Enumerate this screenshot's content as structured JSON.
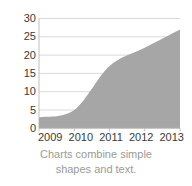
{
  "chart_data": {
    "type": "area",
    "title": "",
    "subtitle": "",
    "xlabel": "",
    "ylabel": "",
    "categories": [
      "2009",
      "2010",
      "2011",
      "2012",
      "2013"
    ],
    "x": [
      2009,
      2010,
      2011,
      2012,
      2013
    ],
    "values": [
      3,
      5,
      17,
      22,
      27
    ],
    "series": [
      {
        "name": "",
        "values": [
          3,
          5,
          17,
          22,
          27
        ]
      }
    ],
    "ylim": [
      0,
      30
    ],
    "yticks": [
      0,
      5,
      10,
      15,
      20,
      25,
      30
    ],
    "ytick_labels": [
      "0",
      "5",
      "10",
      "15",
      "20",
      "25",
      "30"
    ],
    "xtick_labels": [
      "2009",
      "2010",
      "2011",
      "2012",
      "2013"
    ],
    "grid": "horizontal",
    "legend": "none",
    "smoothed": true,
    "colors": {
      "area_fill": "#a6a6a6",
      "gridline": "#d9d9d9",
      "axis_line": "#bfbfbf",
      "tick_text": "#3a3a3a",
      "caption_text": "#9a9a9a",
      "background": "#ffffff"
    }
  },
  "caption": {
    "line1": "Charts combine simple",
    "line2": "shapes and text."
  }
}
